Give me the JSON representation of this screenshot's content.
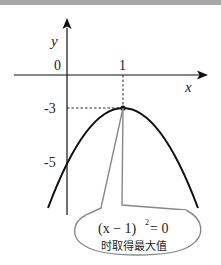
{
  "figure": {
    "axes": {
      "x_label": "x",
      "y_label": "y",
      "origin_label": "0",
      "x_tick": "1",
      "y_ticks": [
        "-3",
        "-5"
      ]
    },
    "curve": {
      "equation": "y = -(x-1)^2 - 3",
      "vertex": [
        1,
        -3
      ],
      "y_intercept": -5
    },
    "callout": {
      "line1": "(x − 1)² = 0",
      "line1_base": "(x − 1)",
      "line1_exp": "2",
      "line1_rhs": "= 0",
      "line2": "时取得最大值"
    },
    "colors": {
      "curve": "#111111",
      "callout_stroke": "#888888",
      "text": "#222222"
    }
  }
}
